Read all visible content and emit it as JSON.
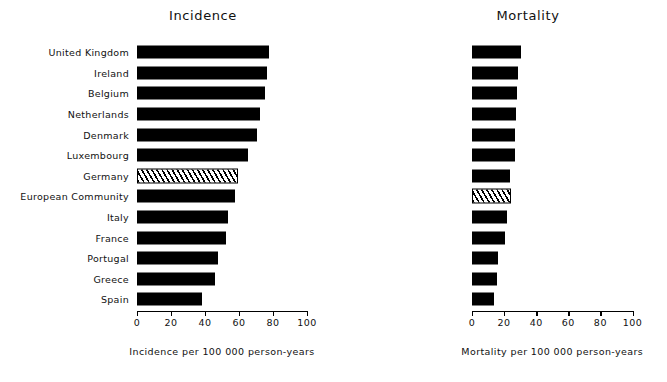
{
  "chart_data": [
    {
      "type": "bar",
      "orientation": "horizontal",
      "title": "Incidence",
      "xlabel": "Incidence per 100 000 person-years",
      "ylabel": "",
      "xlim": [
        0,
        100
      ],
      "xticks": [
        0,
        20,
        40,
        60,
        80,
        100
      ],
      "xtick_labels": [
        "0",
        "20",
        "40",
        "60",
        "80",
        "100"
      ],
      "grid": false,
      "legend": "none",
      "categories": [
        "United Kingdom",
        "Ireland",
        "Luxembourg",
        "Belgium",
        "Netherlands",
        "Denmark",
        "European Community",
        "Germany",
        "Italy",
        "France",
        "Portugal",
        "Greece",
        "Spain"
      ],
      "values": [
        77.5,
        76.5,
        75,
        72.5,
        70.5,
        65,
        58,
        57.5,
        53.5,
        52.5,
        47.5,
        46,
        38.5
      ],
      "highlight_category": "European Community",
      "highlight_style": "hatched"
    },
    {
      "type": "bar",
      "orientation": "horizontal",
      "title": "Mortality",
      "xlabel": "Mortality per 100 000 person-years",
      "ylabel": "",
      "xlim": [
        0,
        100
      ],
      "xticks": [
        0,
        20,
        40,
        60,
        80,
        100
      ],
      "xtick_labels": [
        "0",
        "20",
        "40",
        "60",
        "80",
        "100"
      ],
      "grid": false,
      "legend": "none",
      "categories": [
        "United Kingdom",
        "Ireland",
        "Belgium",
        "Netherlands",
        "Denmark",
        "Luxembourg",
        "Germany",
        "European Community",
        "Italy",
        "France",
        "Portugal",
        "Greece",
        "Spain"
      ],
      "values": [
        30.5,
        28.5,
        28,
        27.5,
        27,
        26.5,
        23.5,
        23,
        21.5,
        20.5,
        16.5,
        15.5,
        14
      ],
      "highlight_category": "European Community",
      "highlight_style": "hatched"
    }
  ],
  "colors": {
    "bar_fill": "#000000",
    "highlight_fill": "#ffffff",
    "axis": "#000000",
    "background": "#ffffff",
    "text": "#111111"
  }
}
